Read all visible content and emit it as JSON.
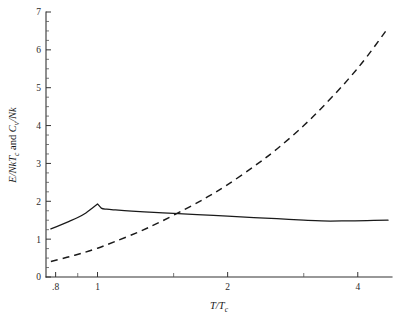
{
  "chart_data": {
    "type": "line",
    "title": "",
    "subtitle": "",
    "xlabel": "T/T_c",
    "xlabel_main": "T/T",
    "xlabel_sub": "c",
    "ylabel": "E/NkT_c and C_v/Nk",
    "ylabel_part1": "E/NkT",
    "ylabel_sub1": "c",
    "ylabel_mid": " and ",
    "ylabel_part2": "C",
    "ylabel_sub2": "v",
    "ylabel_part3": "/Nk",
    "xscale": "log",
    "yscale": "linear",
    "xlim": [
      0.76,
      4.8
    ],
    "ylim": [
      0,
      7
    ],
    "grid": false,
    "legend": "none",
    "x_tick_labels": [
      ".8",
      "1",
      "2",
      "4"
    ],
    "x_tick_values": [
      0.8,
      1,
      2,
      4
    ],
    "x_minor_ticks": [
      0.9,
      1.5,
      3
    ],
    "y_tick_labels": [
      "0",
      "1",
      "2",
      "3",
      "4",
      "5",
      "6",
      "7"
    ],
    "y_tick_values": [
      0,
      1,
      2,
      3,
      4,
      5,
      6,
      7
    ],
    "y_minor_step": 0.25,
    "series": [
      {
        "name": "E/NkT_c",
        "style": "solid",
        "color": "#1a1a1a",
        "x": [
          0.78,
          0.82,
          0.86,
          0.9,
          0.94,
          0.97,
          1.0,
          1.02,
          1.05,
          1.1,
          1.2,
          1.35,
          1.5,
          1.7,
          2.0,
          2.3,
          2.6,
          3.0,
          3.3,
          3.7,
          4.2,
          4.7
        ],
        "y": [
          1.27,
          1.37,
          1.47,
          1.57,
          1.69,
          1.81,
          1.93,
          1.82,
          1.79,
          1.77,
          1.74,
          1.71,
          1.68,
          1.65,
          1.61,
          1.57,
          1.54,
          1.5,
          1.48,
          1.48,
          1.49,
          1.5
        ]
      },
      {
        "name": "C_v/Nk",
        "style": "dashed",
        "color": "#1a1a1a",
        "x": [
          0.78,
          0.85,
          0.92,
          1.0,
          1.1,
          1.25,
          1.4,
          1.6,
          1.8,
          2.0,
          2.3,
          2.6,
          3.0,
          3.4,
          3.8,
          4.2,
          4.7
        ],
        "y": [
          0.41,
          0.52,
          0.63,
          0.76,
          0.94,
          1.2,
          1.46,
          1.8,
          2.12,
          2.44,
          2.92,
          3.38,
          4.0,
          4.62,
          5.22,
          5.82,
          6.58
        ]
      }
    ]
  }
}
